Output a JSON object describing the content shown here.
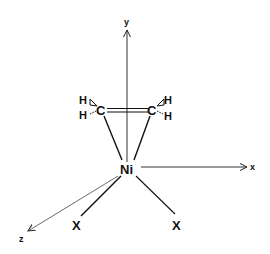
{
  "figure": {
    "colors": {
      "ink": "#111111",
      "axis": "#333333",
      "background": "#ffffff"
    },
    "axes": {
      "x": {
        "label": "x"
      },
      "y": {
        "label": "y"
      },
      "z": {
        "label": "z"
      }
    },
    "metal": {
      "label": "Ni"
    },
    "ethylene": {
      "carbon_left": {
        "label": "C"
      },
      "carbon_right": {
        "label": "C"
      },
      "h_left_top": {
        "label": "H"
      },
      "h_left_bottom": {
        "label": "H"
      },
      "h_right_top": {
        "label": "H"
      },
      "h_right_bottom": {
        "label": "H"
      }
    },
    "ligands": [
      {
        "label": "X"
      },
      {
        "label": "X"
      }
    ]
  }
}
